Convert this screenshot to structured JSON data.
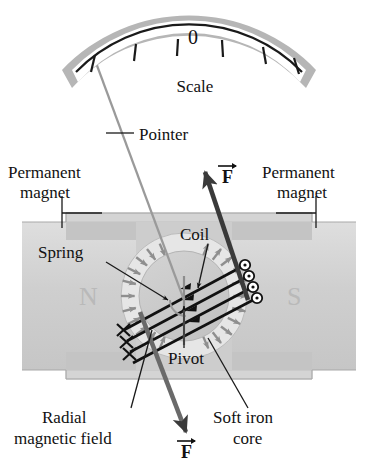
{
  "figure": {
    "type": "diagram",
    "background": "#ffffff"
  },
  "scale": {
    "zero_label": "0",
    "caption": "Scale",
    "tick_count": 6,
    "frame_color": "#b3b3b3",
    "face_color": "#ffffff",
    "arc_color": "#1a1a1a"
  },
  "labels": {
    "pointer": "Pointer",
    "permanent_magnet_left_line1": "Permanent",
    "permanent_magnet_left_line2": "magnet",
    "permanent_magnet_right_line1": "Permanent",
    "permanent_magnet_right_line2": "magnet",
    "coil": "Coil",
    "spring": "Spring",
    "pivot": "Pivot",
    "radial_field_line1": "Radial",
    "radial_field_line2": "magnetic field",
    "soft_iron_line1": "Soft iron",
    "soft_iron_line2": "core",
    "force_upper": "F",
    "force_lower": "F",
    "pole_north": "N",
    "pole_south": "S"
  },
  "colors": {
    "magnet_body": "#cfcfcf",
    "magnet_body_light": "#d9d9d9",
    "pole_piece": "#c4c4c4",
    "core": "#c9c9c9",
    "core_ring": "#e6e6e6",
    "field_arrow": "#8f8f8f",
    "pointer": "#9a9a9a",
    "ink": "#111111",
    "leader": "#1a1a1a",
    "force_arrow": "#3a3a3a"
  },
  "coil": {
    "turn_count": 4,
    "out_of_page_markers": 4,
    "into_page_markers": 3,
    "marker_out_symbol": "dot-in-circle",
    "marker_in_symbol": "cross"
  },
  "field": {
    "left_pole": "N",
    "right_pole": "S",
    "left_arrow_direction": "inward-toward-core",
    "right_arrow_direction": "outward-from-core",
    "arrow_count_each_side": 11
  }
}
